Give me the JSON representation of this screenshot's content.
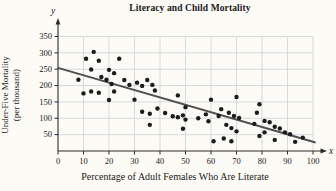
{
  "page": {
    "background": "#fcfbf6"
  },
  "chart_data": {
    "type": "scatter",
    "title": "Literacy and Child Mortality",
    "xlabel": "Percentage of Adult Females Who Are Literate",
    "ylabel_line1": "Under-Five Mortality",
    "ylabel_line2": "(per thousand)",
    "x_axis_symbol": "x",
    "y_axis_symbol": "y",
    "xlim": [
      0,
      100
    ],
    "ylim": [
      0,
      350
    ],
    "x_ticks": [
      0,
      10,
      20,
      30,
      40,
      50,
      60,
      70,
      80,
      90,
      100
    ],
    "y_ticks": [
      50,
      100,
      150,
      200,
      250,
      300,
      350
    ],
    "grid": true,
    "legend": "none",
    "points": [
      [
        8,
        218
      ],
      [
        11,
        282
      ],
      [
        13,
        249
      ],
      [
        14,
        303
      ],
      [
        16,
        276
      ],
      [
        17,
        226
      ],
      [
        19,
        218
      ],
      [
        20,
        248
      ],
      [
        21,
        205
      ],
      [
        22,
        238
      ],
      [
        24,
        282
      ],
      [
        10,
        176
      ],
      [
        13,
        182
      ],
      [
        16,
        178
      ],
      [
        22,
        182
      ],
      [
        20,
        156
      ],
      [
        26,
        217
      ],
      [
        28,
        202
      ],
      [
        31,
        209
      ],
      [
        33,
        199
      ],
      [
        35,
        217
      ],
      [
        37,
        202
      ],
      [
        30,
        157
      ],
      [
        33,
        120
      ],
      [
        36,
        114
      ],
      [
        36,
        80
      ],
      [
        38,
        185
      ],
      [
        39,
        130
      ],
      [
        42,
        116
      ],
      [
        45,
        106
      ],
      [
        47,
        103
      ],
      [
        47,
        170
      ],
      [
        49,
        109
      ],
      [
        50,
        96
      ],
      [
        50,
        134
      ],
      [
        49,
        68
      ],
      [
        55,
        100
      ],
      [
        58,
        112
      ],
      [
        59,
        91
      ],
      [
        60,
        157
      ],
      [
        61,
        30
      ],
      [
        63,
        107
      ],
      [
        64,
        128
      ],
      [
        65,
        38
      ],
      [
        66,
        80
      ],
      [
        67,
        117
      ],
      [
        68,
        30
      ],
      [
        68,
        70
      ],
      [
        69,
        107
      ],
      [
        70,
        60
      ],
      [
        70,
        165
      ],
      [
        71,
        101
      ],
      [
        77,
        83
      ],
      [
        78,
        117
      ],
      [
        79,
        143
      ],
      [
        81,
        92
      ],
      [
        83,
        88
      ],
      [
        85,
        74
      ],
      [
        87,
        69
      ],
      [
        79,
        46
      ],
      [
        81,
        57
      ],
      [
        89,
        57
      ],
      [
        91,
        51
      ],
      [
        85,
        34
      ],
      [
        93,
        28
      ],
      [
        96,
        41
      ]
    ],
    "trend_line": {
      "x1": 0,
      "y1": 254,
      "x2": 101,
      "y2": 26
    },
    "colors": {
      "point": "#1c1c1c",
      "trend": "#4f4f4f",
      "grid": "#ccd3d6",
      "axis": "#2b2b2b",
      "text": "#1a1a1a"
    }
  }
}
